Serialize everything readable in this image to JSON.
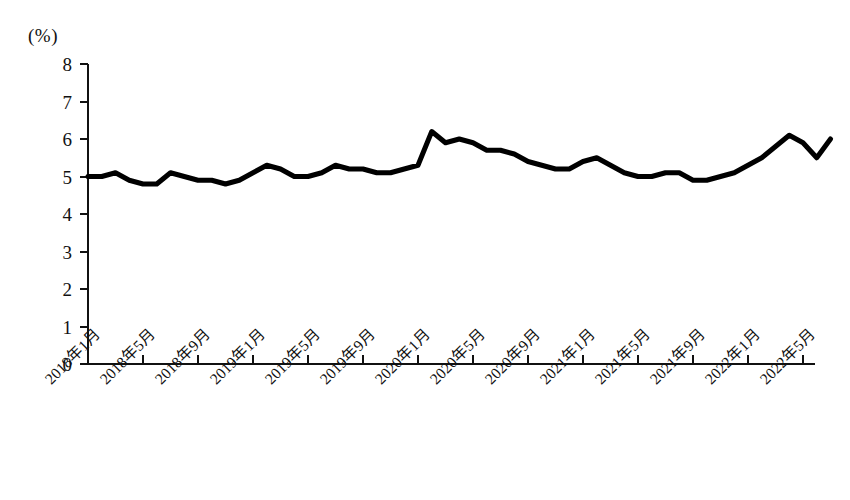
{
  "chart_data": {
    "type": "line",
    "title": "",
    "subtitle": "",
    "xlabel": "",
    "ylabel": "(%)",
    "unit_label": "(%)",
    "ylim": [
      0,
      8
    ],
    "ytick_values": [
      8,
      7,
      6,
      5,
      4,
      3,
      2,
      1,
      0
    ],
    "ytick_labels": [
      "8",
      "7",
      "6",
      "5",
      "4",
      "3",
      "2",
      "1",
      "0"
    ],
    "grid": false,
    "legend": "none",
    "line_color": "#000000",
    "line_width_px": 5,
    "xtick_labels": [
      "2018年1月",
      "2018年5月",
      "2018年9月",
      "2019年1月",
      "2019年5月",
      "2019年9月",
      "2020年1月",
      "2020年5月",
      "2020年9月",
      "2021年1月",
      "2021年5月",
      "2021年9月",
      "2022年1月",
      "2022年5月"
    ],
    "xtick_indices": [
      0,
      4,
      8,
      12,
      16,
      20,
      24,
      28,
      32,
      36,
      40,
      44,
      48,
      52
    ],
    "x": [
      "2018年1月",
      "2018年2月",
      "2018年3月",
      "2018年4月",
      "2018年5月",
      "2018年6月",
      "2018年7月",
      "2018年8月",
      "2018年9月",
      "2018年10月",
      "2018年11月",
      "2018年12月",
      "2019年1月",
      "2019年2月",
      "2019年3月",
      "2019年4月",
      "2019年5月",
      "2019年6月",
      "2019年7月",
      "2019年8月",
      "2019年9月",
      "2019年10月",
      "2019年11月",
      "2019年12月",
      "2020年1月",
      "2020年2月",
      "2020年3月",
      "2020年4月",
      "2020年5月",
      "2020年6月",
      "2020年7月",
      "2020年8月",
      "2020年9月",
      "2020年10月",
      "2020年11月",
      "2020年12月",
      "2021年1月",
      "2021年2月",
      "2021年3月",
      "2021年4月",
      "2021年5月",
      "2021年6月",
      "2021年7月",
      "2021年8月",
      "2021年9月",
      "2021年10月",
      "2021年11月",
      "2021年12月",
      "2022年1月",
      "2022年2月",
      "2022年3月",
      "2022年4月",
      "2022年5月",
      "2022年6月",
      "2022年7月"
    ],
    "values": [
      5.0,
      5.0,
      5.1,
      4.9,
      4.8,
      4.8,
      5.1,
      5.0,
      4.9,
      4.9,
      4.8,
      4.9,
      5.1,
      5.3,
      5.2,
      5.0,
      5.0,
      5.1,
      5.3,
      5.2,
      5.2,
      5.1,
      5.1,
      5.2,
      5.3,
      6.2,
      5.9,
      6.0,
      5.9,
      5.7,
      5.7,
      5.6,
      5.4,
      5.3,
      5.2,
      5.2,
      5.4,
      5.5,
      5.3,
      5.1,
      5.0,
      5.0,
      5.1,
      5.1,
      4.9,
      4.9,
      5.0,
      5.1,
      5.3,
      5.5,
      5.8,
      6.1,
      5.9,
      5.5,
      6.0
    ],
    "annotations": []
  },
  "axes": {
    "y_axis_top_value": 8,
    "y_axis_bottom_value": 0,
    "x_axis_label_rotation_deg": -45
  }
}
